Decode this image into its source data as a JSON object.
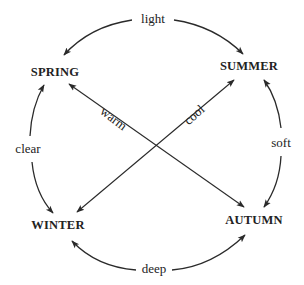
{
  "diagram": {
    "type": "seasonal-cycle",
    "nodes": [
      {
        "id": "spring",
        "label": "SPRING"
      },
      {
        "id": "summer",
        "label": "SUMMER"
      },
      {
        "id": "winter",
        "label": "WINTER"
      },
      {
        "id": "autumn",
        "label": "AUTUMN"
      }
    ],
    "edges": [
      {
        "id": "light",
        "label": "light",
        "from": "spring",
        "to": "summer",
        "bidirectional": true,
        "position": "top"
      },
      {
        "id": "soft",
        "label": "soft",
        "from": "summer",
        "to": "autumn",
        "bidirectional": true,
        "position": "right"
      },
      {
        "id": "deep",
        "label": "deep",
        "from": "winter",
        "to": "autumn",
        "bidirectional": true,
        "position": "bottom"
      },
      {
        "id": "clear",
        "label": "clear",
        "from": "spring",
        "to": "winter",
        "bidirectional": true,
        "position": "left"
      },
      {
        "id": "warm",
        "label": "warm",
        "from": "spring",
        "to": "autumn",
        "bidirectional": true,
        "position": "diagonal"
      },
      {
        "id": "cool",
        "label": "cool",
        "from": "winter",
        "to": "summer",
        "bidirectional": true,
        "position": "diagonal"
      }
    ],
    "colors": {
      "ink": "#222222",
      "background": "#ffffff"
    }
  }
}
